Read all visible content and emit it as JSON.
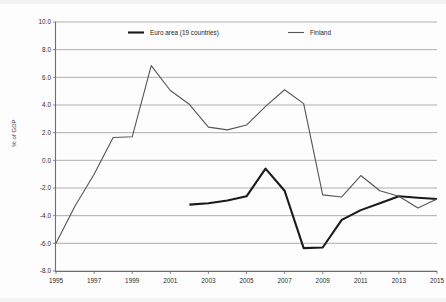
{
  "chart_data": {
    "type": "line",
    "title": "",
    "xlabel": "",
    "ylabel": "% of GDP",
    "xlim": [
      1995,
      2015
    ],
    "ylim": [
      -8.0,
      10.0
    ],
    "ytick_step": 2.0,
    "xtick_step": 2,
    "grid": true,
    "legend_position": "top-inside",
    "ytick_labels": [
      "10.0",
      "8.0",
      "6.0",
      "4.0",
      "2.0",
      "0.0",
      "-2.0",
      "-4.0",
      "-6.0",
      "-8.0"
    ],
    "ytick_values": [
      10.0,
      8.0,
      6.0,
      4.0,
      2.0,
      0.0,
      -2.0,
      -4.0,
      -6.0,
      -8.0
    ],
    "xtick_labels": [
      "1995",
      "1997",
      "1999",
      "2001",
      "2003",
      "2005",
      "2007",
      "2009",
      "2011",
      "2013",
      "2015"
    ],
    "xtick_values": [
      1995,
      1997,
      1999,
      2001,
      2003,
      2005,
      2007,
      2009,
      2011,
      2013,
      2015
    ],
    "x": [
      1995,
      1996,
      1997,
      1998,
      1999,
      2000,
      2001,
      2002,
      2003,
      2004,
      2005,
      2006,
      2007,
      2008,
      2009,
      2010,
      2011,
      2012,
      2013,
      2014,
      2015
    ],
    "series": [
      {
        "name": "Euro area (19 countries)",
        "color": "#1a1a1a",
        "line_width": 2.1,
        "x": [
          2002,
          2003,
          2004,
          2005,
          2006,
          2007,
          2008,
          2009,
          2010,
          2011,
          2012,
          2013,
          2014,
          2015
        ],
        "values": [
          -3.2,
          -3.1,
          -2.9,
          -2.6,
          -0.6,
          -2.2,
          -6.35,
          -6.3,
          -4.3,
          -3.6,
          -3.1,
          -2.6,
          -2.7,
          -2.8
        ]
      },
      {
        "name": "Finland",
        "color": "#555555",
        "line_width": 1.1,
        "x": [
          1995,
          1996,
          1997,
          1998,
          1999,
          2000,
          2001,
          2002,
          2003,
          2004,
          2005,
          2006,
          2007,
          2008,
          2009,
          2010,
          2011,
          2012,
          2013,
          2014,
          2015
        ],
        "values": [
          -6.0,
          -3.3,
          -1.0,
          1.65,
          1.7,
          6.85,
          5.05,
          4.05,
          2.4,
          2.2,
          2.55,
          3.9,
          5.1,
          4.1,
          -2.5,
          -2.65,
          -1.1,
          -2.2,
          -2.6,
          -3.45,
          -2.8
        ]
      }
    ]
  },
  "legend": {
    "items": [
      {
        "label": "Euro area (19 countries)"
      },
      {
        "label": "Finland"
      }
    ]
  },
  "axis": {
    "y_title": "% of GDP"
  }
}
